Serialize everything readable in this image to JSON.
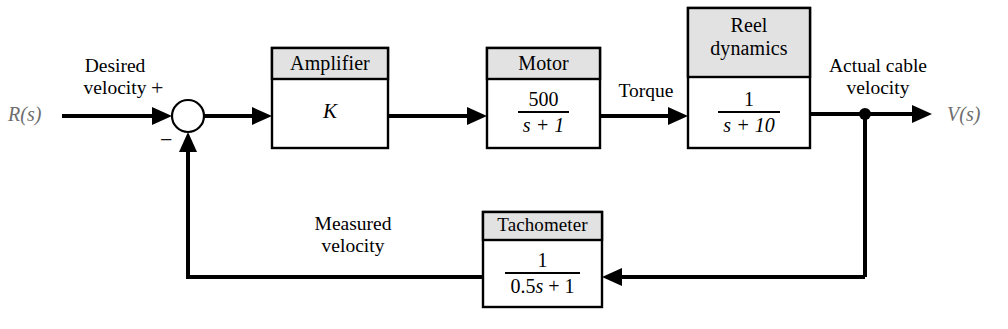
{
  "diagram": {
    "input_label": "R(s)",
    "output_label": "V(s)",
    "sum_plus": "+",
    "sum_minus": "−",
    "signals": {
      "desired_velocity": "Desired\nvelocity",
      "desired_velocity_line1": "Desired",
      "desired_velocity_line2": "velocity",
      "torque": "Torque",
      "actual_cable_velocity_line1": "Actual cable",
      "actual_cable_velocity_line2": "velocity",
      "measured_velocity_line1": "Measured",
      "measured_velocity_line2": "velocity"
    },
    "blocks": [
      {
        "id": "amplifier",
        "title": "Amplifier",
        "body_type": "gain",
        "gain": "K"
      },
      {
        "id": "motor",
        "title": "Motor",
        "body_type": "fraction",
        "numerator": "500",
        "denominator": "s + 1",
        "denominator_var": "s",
        "transfer_function": "500/(s + 1)"
      },
      {
        "id": "reel-dynamics",
        "title": "Reel dynamics",
        "title_line1": "Reel",
        "title_line2": "dynamics",
        "body_type": "fraction",
        "numerator": "1",
        "denominator": "s + 10",
        "denominator_var": "s",
        "transfer_function": "1/(s + 10)"
      },
      {
        "id": "tachometer",
        "title": "Tachometer",
        "body_type": "fraction",
        "numerator": "1",
        "denominator": "0.5s + 1",
        "denominator_prefix": "0.5",
        "denominator_var": "s",
        "denominator_suffix": " + 1",
        "transfer_function": "1/(0.5s + 1)"
      }
    ],
    "colors": {
      "block_header_fill": "#e2e2e2",
      "block_body_fill": "#ffffff",
      "line": "#000000",
      "io_label": "#6d6d6d",
      "background": "#ffffff"
    }
  }
}
